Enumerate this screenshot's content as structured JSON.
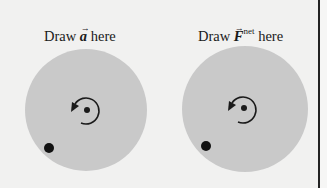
{
  "panels": [
    {
      "id": "acceleration",
      "label_prefix": "Draw",
      "symbol": "a",
      "symbol_superscript": "",
      "label_suffix": "here",
      "disk": {
        "cx": 86,
        "cy": 110,
        "r": 61
      },
      "axis_dot": {
        "cx": 87,
        "cy": 110,
        "r": 3
      },
      "mass_dot": {
        "cx": 49,
        "cy": 148,
        "r": 5
      }
    },
    {
      "id": "net-force",
      "label_prefix": "Draw",
      "symbol": "F",
      "symbol_superscript": "net",
      "label_suffix": "here",
      "disk": {
        "cx": 245,
        "cy": 109,
        "r": 63
      },
      "axis_dot": {
        "cx": 244,
        "cy": 108,
        "r": 3
      },
      "mass_dot": {
        "cx": 206,
        "cy": 146,
        "r": 5
      }
    }
  ],
  "colors": {
    "background": "#f1f1f0",
    "disk": "#c9c9c9",
    "ink": "#1a1a1a"
  },
  "rotation_direction": "counterclockwise"
}
